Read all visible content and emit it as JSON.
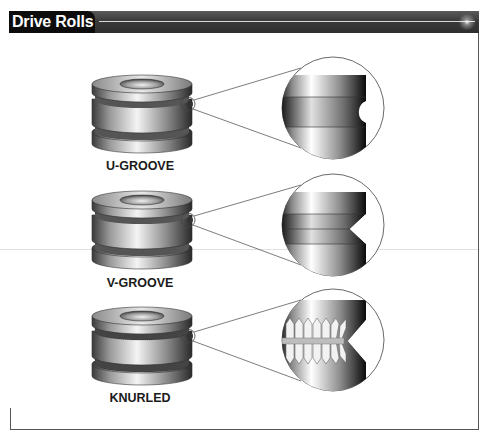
{
  "header": {
    "title": "Drive Rolls",
    "bar_color": "#3a3a3a",
    "tab_color": "#0c0c0c"
  },
  "rolls": [
    {
      "label": "U-GROOVE",
      "groove_type": "u-groove"
    },
    {
      "label": "V-GROOVE",
      "groove_type": "v-groove"
    },
    {
      "label": "KNURLED",
      "groove_type": "knurled"
    }
  ]
}
